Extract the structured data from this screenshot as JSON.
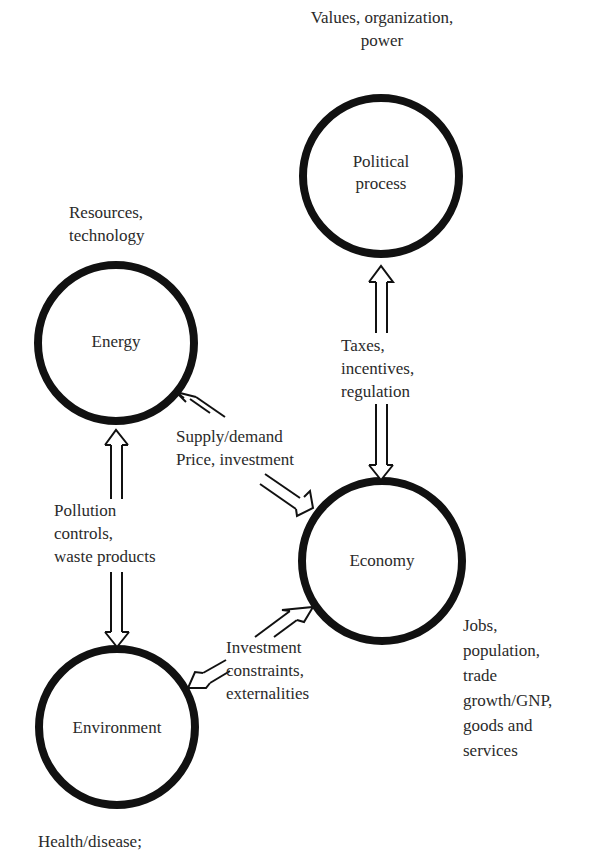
{
  "diagram": {
    "nodes": {
      "political": {
        "label_line1": "Political",
        "label_line2": "process",
        "annotation_line1": "Values, organization,",
        "annotation_line2": "power"
      },
      "energy": {
        "label": "Energy",
        "annotation_line1": "Resources,",
        "annotation_line2": "technology"
      },
      "economy": {
        "label": "Economy",
        "annotation_lines": [
          "Jobs,",
          "population,",
          "trade",
          "growth/GNP,",
          "goods and",
          "services"
        ]
      },
      "environment": {
        "label": "Environment",
        "annotation_line1": "Health/disease;"
      }
    },
    "edges": {
      "political_economy": {
        "lines": [
          "Taxes,",
          "incentives,",
          "regulation"
        ]
      },
      "energy_economy": {
        "lines": [
          "Supply/demand",
          "Price, investment"
        ]
      },
      "energy_environment": {
        "lines": [
          "Pollution",
          "controls,",
          "waste products"
        ]
      },
      "economy_environment": {
        "lines": [
          "Investment",
          "constraints,",
          "externalities"
        ]
      }
    }
  }
}
